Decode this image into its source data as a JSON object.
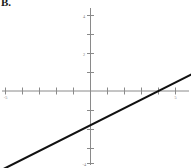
{
  "panel": {
    "label": "B."
  },
  "chart_data": {
    "type": "line",
    "title": "B.",
    "xlabel": "",
    "ylabel": "",
    "xlim": [
      -5.3,
      5.3
    ],
    "ylim": [
      -4.3,
      4.3
    ],
    "grid": false,
    "legend": null,
    "x_ticks": [
      -5,
      -4,
      -3,
      -2,
      -1,
      1,
      2,
      3,
      4,
      5
    ],
    "x_tick_labels": [
      "-5",
      "",
      "",
      "",
      "",
      "",
      "",
      "",
      "",
      "5"
    ],
    "y_ticks": [
      -4,
      -3,
      -2,
      -1,
      1,
      2,
      3,
      4
    ],
    "y_tick_labels": [
      "-4",
      "",
      "",
      "",
      "",
      "2",
      "",
      "4"
    ],
    "series": [
      {
        "name": "line",
        "slope": 0.45,
        "intercept": -1.8,
        "x": [
          -5.3,
          5.3
        ],
        "y": [
          -4.185,
          0.585
        ],
        "color": "#111111"
      }
    ],
    "annotations": []
  },
  "axes": {
    "x_axis_name": "x-axis",
    "y_axis_name": "y-axis",
    "axis_color": "#8a8a8a",
    "line_color": "#111111"
  },
  "tick_labels": {
    "x_left": "-5",
    "x_right": "5",
    "y_top": "4",
    "y_mid": "2",
    "y_bottom": "-4"
  }
}
